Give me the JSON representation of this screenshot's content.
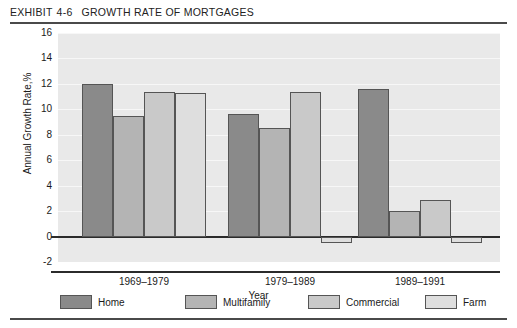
{
  "exhibit": {
    "label": "EXHIBIT",
    "number": "4-6",
    "title": "GROWTH RATE OF MORTGAGES"
  },
  "chart_data": {
    "type": "bar",
    "title": "GROWTH RATE OF MORTGAGES",
    "xlabel": "Year",
    "ylabel": "Annual Growth Rate,%",
    "categories": [
      "1969–1979",
      "1979–1989",
      "1989–1991"
    ],
    "series": [
      {
        "name": "Home",
        "color": "#8a8a8a",
        "values": [
          12.0,
          9.6,
          11.6
        ]
      },
      {
        "name": "Multifamily",
        "color": "#b4b4b4",
        "values": [
          9.5,
          8.5,
          2.0
        ]
      },
      {
        "name": "Commercial",
        "color": "#c9c9c9",
        "values": [
          11.4,
          11.4,
          2.9
        ]
      },
      {
        "name": "Farm",
        "color": "#dedede",
        "values": [
          11.3,
          -0.5,
          -0.5
        ]
      }
    ],
    "ylim": [
      -2,
      16
    ],
    "yticks": [
      16,
      14,
      12,
      10,
      8,
      6,
      4,
      2,
      0,
      -2
    ],
    "ytick_labels": [
      "16",
      "14",
      "12",
      "10",
      "8",
      "6",
      "4",
      "2",
      "0",
      "-2"
    ],
    "grid": true,
    "legend_position": "bottom"
  }
}
